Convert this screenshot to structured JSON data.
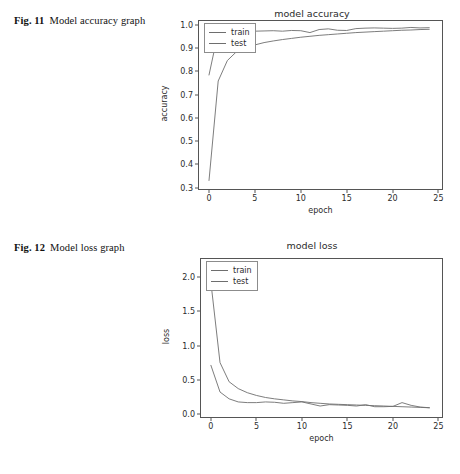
{
  "page": {
    "background": "#ffffff",
    "line_color": "#6e6e6e",
    "axis_color": "#555555"
  },
  "captions": {
    "fig11": {
      "number": "Fig. 11",
      "text": "Model accuracy graph"
    },
    "fig12": {
      "number": "Fig. 12",
      "text": "Model loss graph"
    }
  },
  "chart_data": [
    {
      "id": "accuracy",
      "type": "line",
      "title": "model accuracy",
      "xlabel": "epoch",
      "ylabel": "accuracy",
      "xlim": [
        -1.2,
        25.5
      ],
      "ylim": [
        0.29,
        1.02
      ],
      "xticks": [
        0,
        5,
        10,
        15,
        20,
        25
      ],
      "xticklabels": [
        "0",
        "5",
        "10",
        "15",
        "20",
        "25"
      ],
      "yticks": [
        0.3,
        0.4,
        0.5,
        0.6,
        0.7,
        0.8,
        0.9,
        1.0
      ],
      "yticklabels": [
        "0.3",
        "0.4",
        "0.5",
        "0.6",
        "0.7",
        "0.8",
        "0.9",
        "1.0"
      ],
      "grid": false,
      "legend_position": "upper left",
      "x": [
        0,
        1,
        2,
        3,
        4,
        5,
        6,
        7,
        8,
        9,
        10,
        11,
        12,
        13,
        14,
        15,
        16,
        17,
        18,
        19,
        20,
        21,
        22,
        23,
        24
      ],
      "series": [
        {
          "name": "train",
          "values": [
            0.331,
            0.758,
            0.846,
            0.884,
            0.901,
            0.913,
            0.923,
            0.93,
            0.936,
            0.941,
            0.946,
            0.95,
            0.954,
            0.957,
            0.96,
            0.963,
            0.966,
            0.968,
            0.97,
            0.972,
            0.974,
            0.976,
            0.977,
            0.979,
            0.98
          ]
        },
        {
          "name": "test",
          "values": [
            0.784,
            0.968,
            0.971,
            0.972,
            0.971,
            0.972,
            0.973,
            0.974,
            0.972,
            0.975,
            0.974,
            0.966,
            0.979,
            0.982,
            0.976,
            0.975,
            0.983,
            0.985,
            0.986,
            0.985,
            0.984,
            0.985,
            0.988,
            0.986,
            0.987
          ]
        }
      ]
    },
    {
      "id": "loss",
      "type": "line",
      "title": "model loss",
      "xlabel": "epoch",
      "ylabel": "loss",
      "xlim": [
        -1.2,
        25.5
      ],
      "ylim": [
        -0.06,
        2.28
      ],
      "xticks": [
        0,
        5,
        10,
        15,
        20,
        25
      ],
      "xticklabels": [
        "0",
        "5",
        "10",
        "15",
        "20",
        "25"
      ],
      "yticks": [
        0.0,
        0.5,
        1.0,
        1.5,
        2.0
      ],
      "yticklabels": [
        "0.0",
        "0.5",
        "1.0",
        "1.5",
        "2.0"
      ],
      "grid": false,
      "legend_position": "upper left",
      "x": [
        0,
        1,
        2,
        3,
        4,
        5,
        6,
        7,
        8,
        9,
        10,
        11,
        12,
        13,
        14,
        15,
        16,
        17,
        18,
        19,
        20,
        21,
        22,
        23,
        24
      ],
      "series": [
        {
          "name": "train",
          "values": [
            1.92,
            0.75,
            0.47,
            0.37,
            0.31,
            0.27,
            0.24,
            0.22,
            0.205,
            0.19,
            0.18,
            0.165,
            0.155,
            0.145,
            0.14,
            0.135,
            0.13,
            0.125,
            0.12,
            0.115,
            0.11,
            0.105,
            0.1,
            0.095,
            0.09
          ]
        },
        {
          "name": "test",
          "values": [
            0.71,
            0.32,
            0.22,
            0.175,
            0.165,
            0.165,
            0.175,
            0.17,
            0.155,
            0.165,
            0.175,
            0.145,
            0.115,
            0.135,
            0.13,
            0.125,
            0.115,
            0.135,
            0.105,
            0.105,
            0.11,
            0.165,
            0.125,
            0.1,
            0.09
          ]
        }
      ]
    }
  ]
}
